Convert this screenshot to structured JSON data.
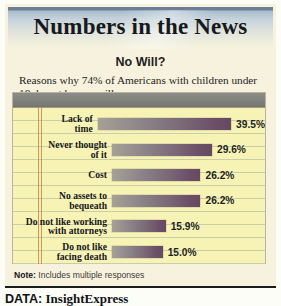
{
  "header": {
    "title": "Numbers in the News"
  },
  "chart_panel": {
    "subtitle": "No Will?",
    "blurb": "Reasons why 74% of Americans with children under 18 do not have a will:",
    "note_label": "Note:",
    "note_text": "Includes multiple responses"
  },
  "source": {
    "label": "DATA:",
    "name": "InsightExpress"
  },
  "colors": {
    "panel_cream": "#f7f2dd",
    "pad_yellow": "#f7f3b5",
    "pad_header_gray": "#838380",
    "bar_start": "#a5a196",
    "bar_end": "#664862",
    "margin_rule_red": "#c4743e",
    "title_band_top": "#6d7f94"
  },
  "chart_data": {
    "type": "bar",
    "orientation": "horizontal",
    "title": "No Will?",
    "subtitle": "Reasons why 74% of Americans with children under 18 do not have a will:",
    "xlabel": "",
    "ylabel": "",
    "xlim": [
      0,
      45
    ],
    "grid": false,
    "legend": "none",
    "value_suffix": "%",
    "categories": [
      "Lack of time",
      "Never thought of it",
      "Cost",
      "No assets to bequeath",
      "Do not like working with attorneys",
      "Do not like facing death"
    ],
    "values": [
      39.5,
      29.6,
      26.2,
      26.2,
      15.9,
      15.0
    ],
    "value_labels": [
      "39.5%",
      "29.6%",
      "26.2%",
      "26.2%",
      "15.9%",
      "15.0%"
    ],
    "category_lines": [
      [
        "Lack of",
        "time"
      ],
      [
        "Never thought",
        "of it"
      ],
      [
        "Cost"
      ],
      [
        "No assets to",
        "bequeath"
      ],
      [
        "Do not like working",
        "with attorneys"
      ],
      [
        "Do not like",
        "facing death"
      ]
    ],
    "note": "Includes multiple responses",
    "source": "DATA: InsightExpress"
  }
}
